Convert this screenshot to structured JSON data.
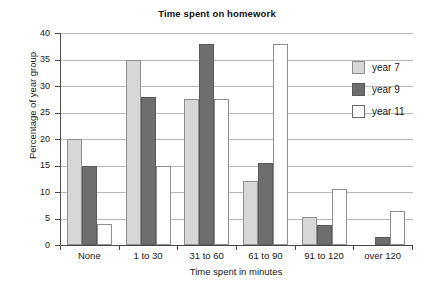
{
  "chart_data": {
    "type": "bar",
    "title": "Time spent on homework",
    "xlabel": "Time spent in minutes",
    "ylabel": "Percentage of year group",
    "categories": [
      "None",
      "1 to 30",
      "31 to 60",
      "61 to 90",
      "91 to 120",
      "over 120"
    ],
    "series": [
      {
        "name": "year 7",
        "color": "#d7d7d7",
        "values": [
          20,
          35,
          27.5,
          12,
          5.3,
          0
        ]
      },
      {
        "name": "year 9",
        "color": "#6e6e6e",
        "values": [
          15,
          28,
          38,
          15.5,
          3.8,
          1.5
        ]
      },
      {
        "name": "year 11",
        "color": "#ffffff",
        "values": [
          4,
          15,
          27.5,
          38,
          10.5,
          6.5
        ]
      }
    ],
    "ylim": [
      0,
      40
    ],
    "yticks": [
      0,
      5,
      10,
      15,
      20,
      25,
      30,
      35,
      40
    ],
    "ytick_labels": [
      "0",
      "5",
      "10",
      "15",
      "20",
      "25",
      "30",
      "35",
      "40"
    ],
    "grid": true,
    "legend_position": "right"
  }
}
